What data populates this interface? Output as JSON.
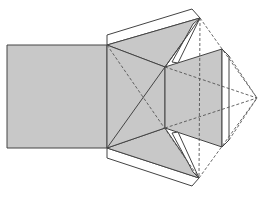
{
  "diagram": {
    "title": "",
    "colors": {
      "fill": "#c8c8c8",
      "stroke": "#444444",
      "dashed": "#555555",
      "background": "#ffffff"
    }
  }
}
